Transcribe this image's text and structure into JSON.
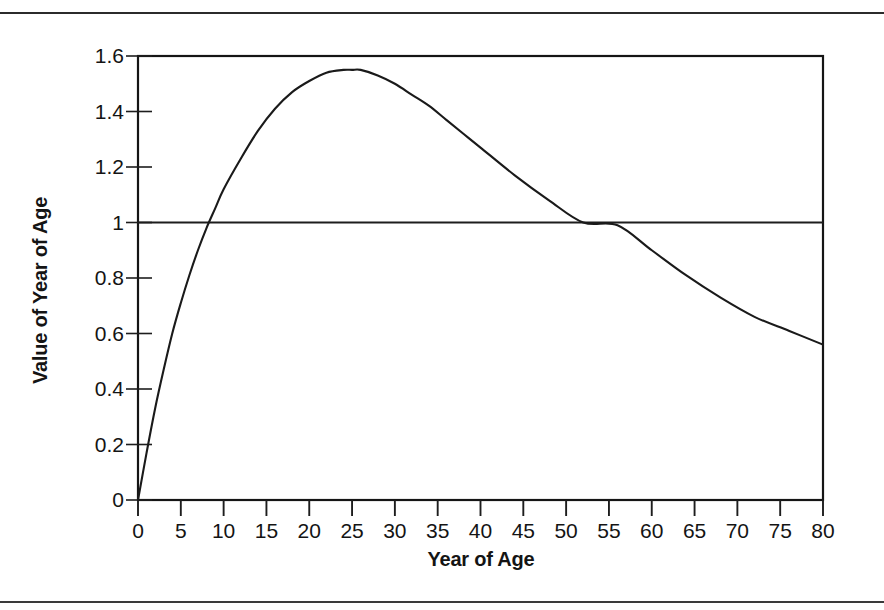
{
  "figure": {
    "y_axis_title": "Value of Year of Age",
    "x_axis_title": "Year of Age"
  },
  "chart_data": {
    "type": "line",
    "title": "",
    "xlabel": "Year of Age",
    "ylabel": "Value of Year of Age",
    "xlim": [
      0,
      80
    ],
    "ylim": [
      0,
      1.6
    ],
    "xticks": [
      0,
      5,
      10,
      15,
      20,
      25,
      30,
      35,
      40,
      45,
      50,
      55,
      60,
      65,
      70,
      75,
      80
    ],
    "xticklabels": [
      "0",
      "5",
      "10",
      "15",
      "20",
      "25",
      "30",
      "35",
      "40",
      "45",
      "50",
      "55",
      "60",
      "65",
      "70",
      "75",
      "80"
    ],
    "yticks": [
      0,
      0.2,
      0.4,
      0.6,
      0.8,
      1,
      1.2,
      1.4,
      1.6
    ],
    "yticklabels": [
      "0",
      "0.2",
      "0.4",
      "0.6",
      "0.8",
      "1",
      "1.2",
      "1.4",
      "1.6"
    ],
    "grid": false,
    "legend": null,
    "reference_lines": [
      {
        "orientation": "horizontal",
        "value": 1,
        "label": ""
      }
    ],
    "annotations": [
      {
        "text": "peak",
        "x": 25,
        "y": 1.55
      },
      {
        "text": "crosses 1.0 rising",
        "x": 8,
        "y": 1
      },
      {
        "text": "crosses 1.0 falling",
        "x": 56,
        "y": 1
      }
    ],
    "series": [
      {
        "name": "Value of Year of Age",
        "color": "#1a1a1a",
        "x": [
          0,
          1,
          2,
          3,
          4,
          5,
          6,
          7,
          8,
          9,
          10,
          12,
          14,
          16,
          18,
          20,
          22,
          24,
          25,
          26,
          28,
          30,
          32,
          34,
          36,
          38,
          40,
          44,
          48,
          52,
          56,
          60,
          64,
          68,
          72,
          76,
          80
        ],
        "values": [
          0,
          0.17,
          0.33,
          0.47,
          0.6,
          0.71,
          0.81,
          0.9,
          0.98,
          1.05,
          1.12,
          1.23,
          1.33,
          1.41,
          1.47,
          1.51,
          1.54,
          1.55,
          1.55,
          1.55,
          1.53,
          1.5,
          1.46,
          1.42,
          1.37,
          1.32,
          1.27,
          1.17,
          1.08,
          1.0,
          0.99,
          0.9,
          0.81,
          0.73,
          0.66,
          0.61,
          0.56
        ]
      }
    ]
  }
}
